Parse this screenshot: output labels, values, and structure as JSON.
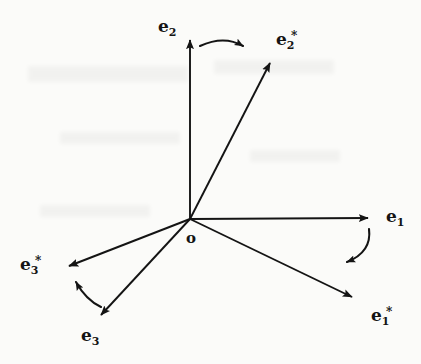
{
  "figure": {
    "background_color": "#fbfbf9",
    "ink_color": "#141414",
    "width": 421,
    "height": 364
  },
  "origin": {
    "label": "o",
    "x": 190,
    "y": 219,
    "label_x": 186,
    "label_y": 229
  },
  "vectors": [
    {
      "id": "e1",
      "label_base": "e",
      "label_sub": "1",
      "label_sup": "",
      "tip_x": 372,
      "tip_y": 218,
      "label_x": 386,
      "label_y": 208
    },
    {
      "id": "e2",
      "label_base": "e",
      "label_sub": "2",
      "label_sup": "",
      "tip_x": 190,
      "tip_y": 34,
      "label_x": 158,
      "label_y": 18
    },
    {
      "id": "e3",
      "label_base": "e",
      "label_sub": "3",
      "label_sup": "",
      "tip_x": 97,
      "tip_y": 320,
      "label_x": 81,
      "label_y": 327
    },
    {
      "id": "e1star",
      "label_base": "e",
      "label_sub": "1",
      "label_sup": "*",
      "tip_x": 358,
      "tip_y": 300,
      "label_x": 371,
      "label_y": 307
    },
    {
      "id": "e2star",
      "label_base": "e",
      "label_sub": "2",
      "label_sup": "*",
      "tip_x": 267,
      "tip_y": 57,
      "label_x": 276,
      "label_y": 31
    },
    {
      "id": "e3star",
      "label_base": "e",
      "label_sub": "3",
      "label_sup": "*",
      "tip_x": 63,
      "tip_y": 268,
      "label_x": 20,
      "label_y": 256
    }
  ],
  "rotation_arcs": [
    {
      "id": "arc-e2-to-e2star",
      "from": "e2",
      "to": "e2star"
    },
    {
      "id": "arc-e1-to-e1star",
      "from": "e1",
      "to": "e1star"
    },
    {
      "id": "arc-e3-to-e3star",
      "from": "e3",
      "to": "e3star"
    }
  ]
}
